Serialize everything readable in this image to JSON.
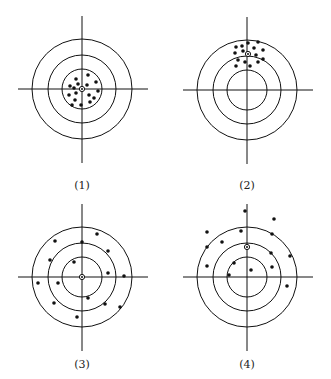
{
  "figure": {
    "colors": {
      "ink": "#111111",
      "background": "#ffffff"
    },
    "ring_radii": [
      20,
      34,
      50
    ],
    "targets": [
      {
        "id": "target-1",
        "label": "(1)",
        "center": [
          82,
          89
        ],
        "marker": [
          82,
          89
        ],
        "label_pos": [
          82,
          180
        ],
        "dots": [
          [
            88,
            75
          ],
          [
            76,
            79
          ],
          [
            96,
            82
          ],
          [
            78,
            84
          ],
          [
            70,
            86
          ],
          [
            87,
            85
          ],
          [
            74,
            88
          ],
          [
            98,
            91
          ],
          [
            76,
            93
          ],
          [
            69,
            95
          ],
          [
            89,
            95
          ],
          [
            94,
            98
          ],
          [
            75,
            100
          ],
          [
            90,
            102
          ],
          [
            72,
            105
          ],
          [
            81,
            105
          ]
        ]
      },
      {
        "id": "target-2",
        "label": "(2)",
        "center": [
          247,
          90
        ],
        "marker": [
          248,
          54
        ],
        "label_pos": [
          247,
          180
        ],
        "dots": [
          [
            236,
            47
          ],
          [
            242,
            46
          ],
          [
            248,
            43
          ],
          [
            258,
            42
          ],
          [
            254,
            48
          ],
          [
            263,
            50
          ],
          [
            235,
            53
          ],
          [
            243,
            51
          ],
          [
            256,
            55
          ],
          [
            238,
            60
          ],
          [
            245,
            62
          ],
          [
            258,
            62
          ],
          [
            263,
            59
          ],
          [
            236,
            66
          ],
          [
            250,
            66
          ]
        ]
      },
      {
        "id": "target-3",
        "label": "(3)",
        "center": [
          82,
          277
        ],
        "marker": [
          82,
          277
        ],
        "label_pos": [
          82,
          359
        ],
        "dots": [
          [
            55,
            241
          ],
          [
            82,
            242
          ],
          [
            97,
            234
          ],
          [
            108,
            251
          ],
          [
            50,
            260
          ],
          [
            74,
            262
          ],
          [
            108,
            273
          ],
          [
            124,
            276
          ],
          [
            38,
            283
          ],
          [
            58,
            283
          ],
          [
            88,
            298
          ],
          [
            105,
            304
          ],
          [
            54,
            303
          ],
          [
            120,
            307
          ],
          [
            77,
            317
          ]
        ]
      },
      {
        "id": "target-4",
        "label": "(4)",
        "center": [
          247,
          277
        ],
        "marker": [
          247,
          247
        ],
        "label_pos": [
          247,
          359
        ],
        "dots": [
          [
            245,
            211
          ],
          [
            274,
            219
          ],
          [
            207,
            232
          ],
          [
            241,
            231
          ],
          [
            272,
            234
          ],
          [
            222,
            242
          ],
          [
            207,
            247
          ],
          [
            271,
            253
          ],
          [
            290,
            256
          ],
          [
            234,
            263
          ],
          [
            207,
            266
          ],
          [
            272,
            267
          ],
          [
            251,
            270
          ],
          [
            229,
            275
          ],
          [
            287,
            286
          ]
        ]
      }
    ]
  }
}
